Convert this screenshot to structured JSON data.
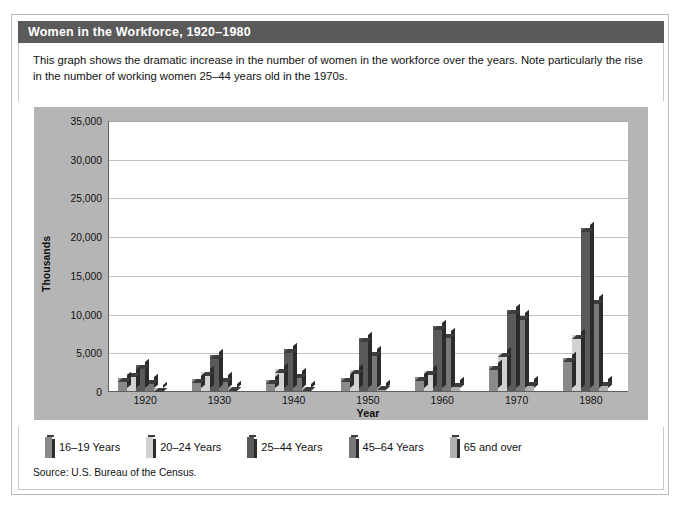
{
  "header": {
    "title": "Women in the Workforce, 1920–1980"
  },
  "caption": {
    "text": "This graph shows the dramatic increase in the number of women in the workforce over the years. Note particularly the rise in the number of working women 25–44 years old in the 1970s."
  },
  "source": {
    "text": "Source: U.S. Bureau of the Census."
  },
  "legend": {
    "position": "bottom",
    "items": [
      {
        "label": "16–19 Years",
        "color": "#8a8a8a"
      },
      {
        "label": "20–24 Years",
        "color": "#d2d2d2"
      },
      {
        "label": "25–44 Years",
        "color": "#5a5a5a"
      },
      {
        "label": "45–64 Years",
        "color": "#787878"
      },
      {
        "label": "65 and over",
        "color": "#b0b0b0"
      }
    ]
  },
  "chart_data": {
    "type": "bar",
    "title": "Women in the Workforce, 1920–1980",
    "xlabel": "Year",
    "ylabel": "Thousands",
    "categories": [
      "1920",
      "1930",
      "1940",
      "1950",
      "1960",
      "1970",
      "1980"
    ],
    "ylim": [
      0,
      35000
    ],
    "yticks": [
      0,
      5000,
      10000,
      15000,
      20000,
      25000,
      30000,
      35000
    ],
    "ytick_labels": [
      "0",
      "5,000",
      "10,000",
      "15,000",
      "20,000",
      "25,000",
      "30,000",
      "35,000"
    ],
    "grid": true,
    "series": [
      {
        "name": "16–19 Years",
        "color": "#8a8a8a",
        "values": [
          1700,
          1600,
          1400,
          1700,
          1800,
          3200,
          4200
        ]
      },
      {
        "name": "20–24 Years",
        "color": "#d2d2d2",
        "values": [
          2300,
          2400,
          2800,
          2700,
          2600,
          4900,
          7200
        ]
      },
      {
        "name": "25–44 Years",
        "color": "#5a5a5a",
        "values": [
          3400,
          4600,
          5400,
          6900,
          8400,
          10400,
          21000
        ]
      },
      {
        "name": "45–64 Years",
        "color": "#787878",
        "values": [
          1400,
          1700,
          2200,
          5000,
          7400,
          9700,
          11800
        ]
      },
      {
        "name": "65 and over",
        "color": "#b0b0b0",
        "values": [
          450,
          500,
          550,
          700,
          1000,
          1100,
          1200
        ]
      }
    ]
  }
}
